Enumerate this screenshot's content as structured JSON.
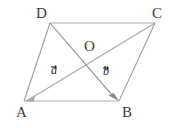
{
  "figure": {
    "type": "geometry-diagram",
    "background_color": "#ffffff",
    "colors": {
      "side_light": "#c8c8c8",
      "side_medium": "#a0a0a0",
      "diagonal_dark": "#8a8a8a",
      "label": "#3a3a3a",
      "vector_label": "#1c1c1c"
    },
    "vertices": [
      {
        "name": "A",
        "label": "A",
        "x": 24,
        "y": 101,
        "label_x": 16,
        "label_y": 105
      },
      {
        "name": "B",
        "label": "B",
        "x": 119,
        "y": 101,
        "label_x": 122,
        "label_y": 105
      },
      {
        "name": "C",
        "label": "C",
        "x": 155,
        "y": 23,
        "label_x": 152,
        "label_y": 6
      },
      {
        "name": "D",
        "label": "D",
        "x": 50,
        "y": 23,
        "label_x": 36,
        "label_y": 6
      },
      {
        "name": "O",
        "label": "O",
        "x": 90,
        "y": 60,
        "label_x": 84,
        "label_y": 39
      }
    ],
    "edges": [
      {
        "name": "edge-DC",
        "from": "D",
        "to": "C",
        "color": "#c8c8c8"
      },
      {
        "name": "edge-AB",
        "from": "A",
        "to": "B",
        "color": "#c8c8c8"
      },
      {
        "name": "edge-AD",
        "from": "A",
        "to": "D",
        "color": "#a0a0a0"
      },
      {
        "name": "edge-BC",
        "from": "B",
        "to": "C",
        "color": "#a0a0a0"
      }
    ],
    "vectors": [
      {
        "name": "vector-a",
        "label": "a",
        "from": "C",
        "to": "A",
        "label_x": 51,
        "label_y": 64,
        "color": "#a9a9a9"
      },
      {
        "name": "vector-b",
        "label": "b",
        "from": "D",
        "to": "B",
        "label_x": 103,
        "label_y": 65,
        "color": "#8a8a8a"
      }
    ]
  }
}
